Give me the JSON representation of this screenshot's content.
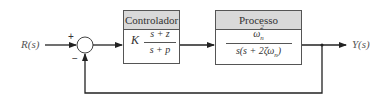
{
  "diagram": {
    "type": "block-diagram",
    "input_label": "R(s)",
    "output_label": "Y(s)",
    "summing_junction": {
      "plus_sign": "+",
      "minus_sign": "−"
    },
    "blocks": [
      {
        "title": "Controlador",
        "gain": "K",
        "numerator": "s + z",
        "denominator": "s + p"
      },
      {
        "title": "Processo",
        "numerator": "ωn²",
        "numerator_base": "ω",
        "numerator_sub": "n",
        "numerator_sup": "2",
        "denominator": "s(s + 2ζωn)",
        "denominator_main": "s(s + 2ζω",
        "denominator_sub": "n",
        "denominator_close": ")"
      }
    ],
    "feedback": "unity negative feedback"
  }
}
